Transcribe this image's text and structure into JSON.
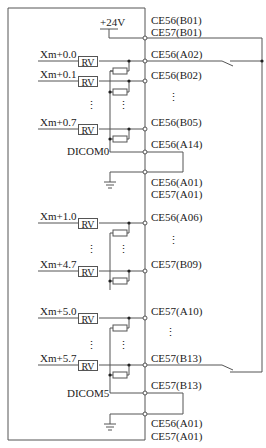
{
  "diagram": {
    "supply_label": "+24V",
    "connectors": {
      "ce56_b01": "CE56(B01)",
      "ce57_b01": "CE57(B01)",
      "ce56_a02": "CE56(A02)",
      "ce56_b02": "CE56(B02)",
      "ce56_b05": "CE56(B05)",
      "ce56_a14": "CE56(A14)",
      "ce56_a01_top": "CE56(A01)",
      "ce57_a01_top": "CE57(A01)",
      "ce56_a06": "CE56(A06)",
      "ce57_b09": "CE57(B09)",
      "ce57_a10": "CE57(A10)",
      "ce57_b13": "CE57(B13)",
      "ce57_b13_com": "CE57(B13)",
      "ce56_a01_bottom": "CE56(A01)",
      "ce57_a01_bottom": "CE57(A01)"
    },
    "inputs": [
      {
        "label": "Xm+0.0",
        "component": "RV"
      },
      {
        "label": "Xm+0.1",
        "component": "RV"
      },
      {
        "label": "Xm+0.7",
        "component": "RV"
      },
      {
        "label": "Xm+1.0",
        "component": "RV"
      },
      {
        "label": "Xm+4.7",
        "component": "RV"
      },
      {
        "label": "Xm+5.0",
        "component": "RV"
      },
      {
        "label": "Xm+5.7",
        "component": "RV"
      }
    ],
    "commons": {
      "dicom0": "DICOM0",
      "dicom5": "DICOM5"
    },
    "ellipsis": "⋮"
  }
}
